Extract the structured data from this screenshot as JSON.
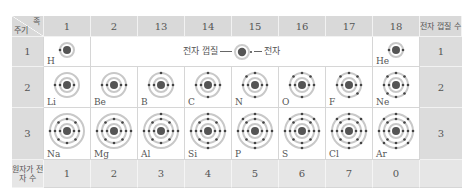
{
  "header": {
    "corner_group_label": "족",
    "corner_period_label": "주기",
    "groups": [
      "1",
      "2",
      "13",
      "14",
      "15",
      "16",
      "17",
      "18"
    ],
    "shell_count_label": "전자 껍질 수"
  },
  "legend": {
    "shell_label": "전자 껍질",
    "electron_label": "전자"
  },
  "rows": [
    {
      "period": "1",
      "shells": "1",
      "elements": [
        {
          "symbol": "H",
          "group": "1",
          "electrons": [
            1
          ]
        },
        {
          "symbol": "He",
          "group": "18",
          "electrons": [
            2
          ]
        }
      ]
    },
    {
      "period": "2",
      "shells": "2",
      "elements": [
        {
          "symbol": "Li",
          "electrons": [
            2,
            1
          ]
        },
        {
          "symbol": "Be",
          "electrons": [
            2,
            2
          ]
        },
        {
          "symbol": "B",
          "electrons": [
            2,
            3
          ]
        },
        {
          "symbol": "C",
          "electrons": [
            2,
            4
          ]
        },
        {
          "symbol": "N",
          "electrons": [
            2,
            5
          ]
        },
        {
          "symbol": "O",
          "electrons": [
            2,
            6
          ]
        },
        {
          "symbol": "F",
          "electrons": [
            2,
            7
          ]
        },
        {
          "symbol": "Ne",
          "electrons": [
            2,
            8
          ]
        }
      ]
    },
    {
      "period": "3",
      "shells": "3",
      "elements": [
        {
          "symbol": "Na",
          "electrons": [
            2,
            8,
            1
          ]
        },
        {
          "symbol": "Mg",
          "electrons": [
            2,
            8,
            2
          ]
        },
        {
          "symbol": "Al",
          "electrons": [
            2,
            8,
            3
          ]
        },
        {
          "symbol": "Si",
          "electrons": [
            2,
            8,
            4
          ]
        },
        {
          "symbol": "P",
          "electrons": [
            2,
            8,
            5
          ]
        },
        {
          "symbol": "S",
          "electrons": [
            2,
            8,
            6
          ]
        },
        {
          "symbol": "Cl",
          "electrons": [
            2,
            8,
            7
          ]
        },
        {
          "symbol": "Ar",
          "electrons": [
            2,
            8,
            8
          ]
        }
      ]
    }
  ],
  "footer": {
    "label": "원자가 전자 수",
    "valence": [
      "1",
      "2",
      "3",
      "4",
      "5",
      "6",
      "7",
      "0"
    ]
  },
  "colors": {
    "header_bg": "#d9d9d9",
    "footer_bg": "#e6e6e6",
    "nucleus": "#555555",
    "shell": "#c8c8c8",
    "electron": "#444444"
  }
}
